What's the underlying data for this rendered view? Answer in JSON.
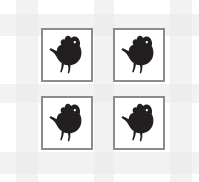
{
  "canvas": {
    "width": 199,
    "height": 182,
    "background_color": "#ffffff"
  },
  "background": {
    "name": "lattice-pattern",
    "description": "faint light gray woven grid bands",
    "band_color": "#f2f2f2",
    "knot_color": "#ededed",
    "horizontal_bands": 3,
    "vertical_bands": 3
  },
  "grid": {
    "rows": 2,
    "columns": 2,
    "card_count": 4,
    "card_border_color": "#8c8c8c",
    "card_background_color": "#ffffff",
    "icon_color": "#231f20",
    "icon_name": "chicken-silhouette-icon",
    "cards": [
      {
        "id": "card-1",
        "position": "top-left",
        "icon": "chicken-silhouette-icon",
        "label": "Chicken"
      },
      {
        "id": "card-2",
        "position": "top-right",
        "icon": "chicken-silhouette-icon",
        "label": "Chicken"
      },
      {
        "id": "card-3",
        "position": "bottom-left",
        "icon": "chicken-silhouette-icon",
        "label": "Chicken"
      },
      {
        "id": "card-4",
        "position": "bottom-right",
        "icon": "chicken-silhouette-icon",
        "label": "Chicken"
      }
    ]
  }
}
